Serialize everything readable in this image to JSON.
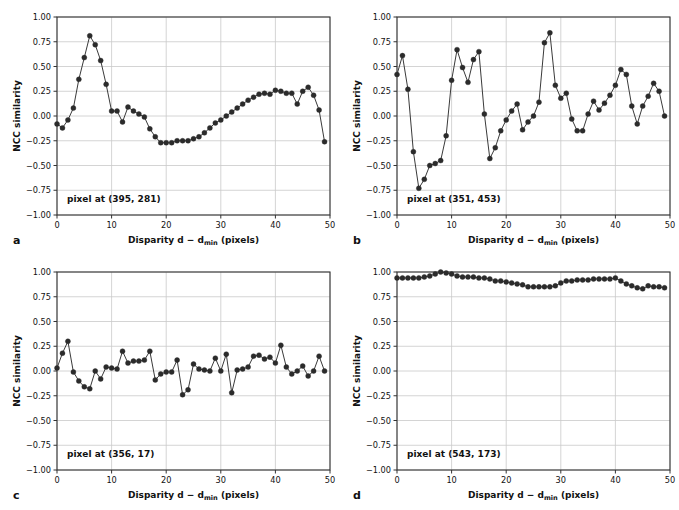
{
  "figure": {
    "background": "#ffffff",
    "marker_color": "#2b2b2b",
    "line_color": "#3a3a3a",
    "grid_color": "#c9c9c9",
    "axis_color": "#333333",
    "panel_count": 4
  },
  "axes": {
    "xlabel_prefix": "Disparity d − d",
    "xlabel_sub": "min",
    "xlabel_suffix": " (pixels)",
    "ylabel": "NCC similarity",
    "xticks": [
      0,
      10,
      20,
      30,
      40,
      50
    ],
    "xtick_labels": [
      "0",
      "10",
      "20",
      "30",
      "40",
      "50"
    ],
    "yticks": [
      1.0,
      0.75,
      0.5,
      0.25,
      0.0,
      -0.25,
      -0.5,
      -0.75,
      -1.0
    ],
    "ytick_labels": [
      "1.00",
      "0.75",
      "0.50",
      "0.25",
      "0.00",
      "−0.25",
      "−0.50",
      "−0.75",
      "−1.00"
    ],
    "xlim": [
      0,
      50
    ],
    "ylim": [
      -1.0,
      1.0
    ],
    "grid": true
  },
  "panels": [
    {
      "letter": "a",
      "annotation": "pixel at (395, 281)"
    },
    {
      "letter": "b",
      "annotation": "pixel at (351, 453)"
    },
    {
      "letter": "c",
      "annotation": "pixel at (356, 17)"
    },
    {
      "letter": "d",
      "annotation": "pixel at (543, 173)"
    }
  ],
  "chart_data": [
    {
      "type": "line",
      "panel": "a",
      "title": "pixel at (395, 281)",
      "xlabel": "Disparity d − d_min (pixels)",
      "ylabel": "NCC similarity",
      "xlim": [
        0,
        50
      ],
      "ylim": [
        -1.0,
        1.0
      ],
      "grid": true,
      "legend": null,
      "x": [
        0,
        1,
        2,
        3,
        4,
        5,
        6,
        7,
        8,
        9,
        10,
        11,
        12,
        13,
        14,
        15,
        16,
        17,
        18,
        19,
        20,
        21,
        22,
        23,
        24,
        25,
        26,
        27,
        28,
        29,
        30,
        31,
        32,
        33,
        34,
        35,
        36,
        37,
        38,
        39,
        40,
        41,
        42,
        43,
        44,
        45,
        46,
        47,
        48,
        49
      ],
      "values": [
        -0.08,
        -0.12,
        -0.04,
        0.08,
        0.37,
        0.59,
        0.81,
        0.72,
        0.56,
        0.32,
        0.05,
        0.05,
        -0.06,
        0.09,
        0.05,
        0.02,
        -0.01,
        -0.13,
        -0.21,
        -0.27,
        -0.27,
        -0.27,
        -0.25,
        -0.25,
        -0.25,
        -0.23,
        -0.21,
        -0.17,
        -0.12,
        -0.07,
        -0.04,
        0.0,
        0.04,
        0.08,
        0.12,
        0.16,
        0.19,
        0.22,
        0.23,
        0.22,
        0.26,
        0.25,
        0.23,
        0.23,
        0.12,
        0.25,
        0.29,
        0.21,
        0.06,
        -0.26
      ]
    },
    {
      "type": "line",
      "panel": "b",
      "title": "pixel at (351, 453)",
      "xlabel": "Disparity d − d_min (pixels)",
      "ylabel": "NCC similarity",
      "xlim": [
        0,
        50
      ],
      "ylim": [
        -1.0,
        1.0
      ],
      "grid": true,
      "legend": null,
      "x": [
        0,
        1,
        2,
        3,
        4,
        5,
        6,
        7,
        8,
        9,
        10,
        11,
        12,
        13,
        14,
        15,
        16,
        17,
        18,
        19,
        20,
        21,
        22,
        23,
        24,
        25,
        26,
        27,
        28,
        29,
        30,
        31,
        32,
        33,
        34,
        35,
        36,
        37,
        38,
        39,
        40,
        41,
        42,
        43,
        44,
        45,
        46,
        47,
        48,
        49
      ],
      "values": [
        0.42,
        0.61,
        0.27,
        -0.36,
        -0.73,
        -0.64,
        -0.5,
        -0.48,
        -0.45,
        -0.2,
        0.36,
        0.67,
        0.49,
        0.34,
        0.57,
        0.65,
        0.02,
        -0.43,
        -0.32,
        -0.15,
        -0.04,
        0.05,
        0.12,
        -0.14,
        -0.06,
        0.0,
        0.14,
        0.74,
        0.84,
        0.31,
        0.18,
        0.23,
        -0.03,
        -0.15,
        -0.15,
        0.02,
        0.15,
        0.06,
        0.13,
        0.21,
        0.31,
        0.47,
        0.42,
        0.1,
        -0.08,
        0.1,
        0.2,
        0.33,
        0.25,
        0.0
      ]
    },
    {
      "type": "line",
      "panel": "c",
      "title": "pixel at (356, 17)",
      "xlabel": "Disparity d − d_min (pixels)",
      "ylabel": "NCC similarity",
      "xlim": [
        0,
        50
      ],
      "ylim": [
        -1.0,
        1.0
      ],
      "grid": true,
      "legend": null,
      "x": [
        0,
        1,
        2,
        3,
        4,
        5,
        6,
        7,
        8,
        9,
        10,
        11,
        12,
        13,
        14,
        15,
        16,
        17,
        18,
        19,
        20,
        21,
        22,
        23,
        24,
        25,
        26,
        27,
        28,
        29,
        30,
        31,
        32,
        33,
        34,
        35,
        36,
        37,
        38,
        39,
        40,
        41,
        42,
        43,
        44,
        45,
        46,
        47,
        48,
        49
      ],
      "values": [
        0.03,
        0.18,
        0.3,
        -0.01,
        -0.1,
        -0.16,
        -0.18,
        0.0,
        -0.08,
        0.04,
        0.03,
        0.02,
        0.2,
        0.08,
        0.1,
        0.1,
        0.11,
        0.2,
        -0.09,
        -0.03,
        -0.01,
        -0.01,
        0.11,
        -0.24,
        -0.19,
        0.07,
        0.02,
        0.01,
        0.0,
        0.13,
        0.0,
        0.17,
        -0.22,
        0.01,
        0.02,
        0.04,
        0.15,
        0.16,
        0.12,
        0.14,
        0.08,
        0.26,
        0.04,
        -0.03,
        0.0,
        0.05,
        -0.05,
        0.0,
        0.15,
        0.0
      ]
    },
    {
      "type": "line",
      "panel": "d",
      "title": "pixel at (543, 173)",
      "xlabel": "Disparity d − d_min (pixels)",
      "ylabel": "NCC similarity",
      "xlim": [
        0,
        50
      ],
      "ylim": [
        -1.0,
        1.0
      ],
      "grid": true,
      "legend": null,
      "x": [
        0,
        1,
        2,
        3,
        4,
        5,
        6,
        7,
        8,
        9,
        10,
        11,
        12,
        13,
        14,
        15,
        16,
        17,
        18,
        19,
        20,
        21,
        22,
        23,
        24,
        25,
        26,
        27,
        28,
        29,
        30,
        31,
        32,
        33,
        34,
        35,
        36,
        37,
        38,
        39,
        40,
        41,
        42,
        43,
        44,
        45,
        46,
        47,
        48,
        49
      ],
      "values": [
        0.94,
        0.94,
        0.94,
        0.94,
        0.94,
        0.95,
        0.96,
        0.98,
        1.0,
        0.99,
        0.98,
        0.96,
        0.95,
        0.95,
        0.95,
        0.94,
        0.94,
        0.93,
        0.91,
        0.91,
        0.9,
        0.89,
        0.88,
        0.87,
        0.85,
        0.85,
        0.85,
        0.85,
        0.85,
        0.86,
        0.89,
        0.91,
        0.91,
        0.92,
        0.92,
        0.92,
        0.93,
        0.93,
        0.93,
        0.93,
        0.94,
        0.91,
        0.88,
        0.86,
        0.84,
        0.83,
        0.86,
        0.85,
        0.85,
        0.84
      ]
    }
  ]
}
